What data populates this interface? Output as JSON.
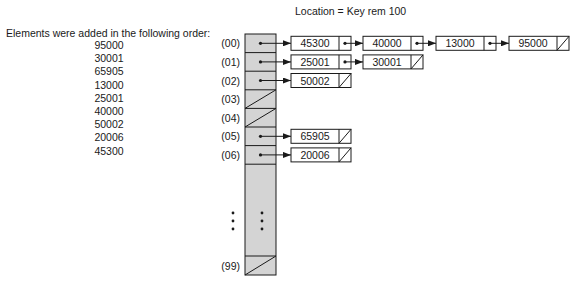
{
  "caption": {
    "title": "Elements were added in the following order:",
    "order": [
      "95000",
      "30001",
      "65905",
      "13000",
      "25001",
      "40000",
      "50002",
      "20006",
      "45300"
    ]
  },
  "formula": "Location = Key rem 100",
  "table": {
    "rows": [
      {
        "label": "(00)",
        "chain": [
          "45300",
          "40000",
          "13000",
          "95000"
        ]
      },
      {
        "label": "(01)",
        "chain": [
          "25001",
          "30001"
        ]
      },
      {
        "label": "(02)",
        "chain": [
          "50002"
        ]
      },
      {
        "label": "(03)",
        "chain": []
      },
      {
        "label": "(04)",
        "chain": []
      },
      {
        "label": "(05)",
        "chain": [
          "65905"
        ]
      },
      {
        "label": "(06)",
        "chain": [
          "20006"
        ]
      }
    ],
    "ellipsis": "⋮",
    "last_row": {
      "label": "(99)",
      "chain": []
    }
  },
  "colors": {
    "bucket_fill": "#d4d4d4",
    "stroke": "#1a1a1a"
  }
}
